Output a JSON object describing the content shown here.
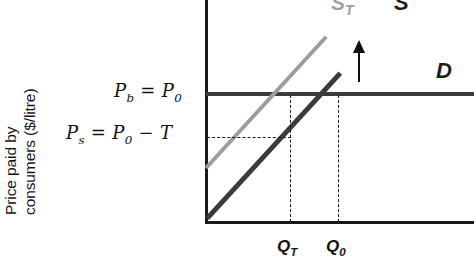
{
  "figure": {
    "type": "supply-demand-tax-incidence-diagram",
    "y_axis_label_line1": "Price paid by",
    "y_axis_label_line2": "consumers ($/litre)"
  },
  "price_labels": {
    "buyer_price": {
      "symbol": "P",
      "subscript": "b",
      "equals": "=",
      "value_symbol": "P",
      "value_subscript": "0",
      "full": "Pb = P0"
    },
    "seller_price": {
      "symbol": "P",
      "subscript": "s",
      "equals": "=",
      "value_symbol": "P",
      "value_subscript": "0",
      "minus": "−",
      "tax_symbol": "T",
      "full": "Ps = P0 − T"
    }
  },
  "curve_labels": {
    "supply_tax": {
      "symbol": "S",
      "subscript": "T"
    },
    "supply": {
      "symbol": "S"
    },
    "demand": {
      "symbol": "D"
    }
  },
  "quantity_labels": {
    "quantity_tax": {
      "symbol": "Q",
      "subscript": "T"
    },
    "quantity_original": {
      "symbol": "Q",
      "subscript": "0"
    }
  },
  "annotations": {
    "shift_arrow": "upward-shift-arrow"
  },
  "colors": {
    "supply_tax_curve": "#9d9d9d",
    "supply_curve": "#3b3b3b",
    "demand_curve": "#3b3b3b",
    "axis": "#1a1a1a",
    "guide_line": "#1a1a1a",
    "background": "#ffffff"
  },
  "chart_data": {
    "type": "line",
    "title": "",
    "xlabel": "",
    "ylabel": "Price paid by consumers ($/litre)",
    "grid": false,
    "legend": "inline-curve-labels",
    "series": [
      {
        "name": "D",
        "description": "Perfectly elastic (horizontal) demand curve at price P0",
        "points": [
          [
            0,
            72
          ],
          [
            100,
            72
          ]
        ]
      },
      {
        "name": "S",
        "description": "Original upward-sloping supply curve",
        "points": [
          [
            0,
            3
          ],
          [
            74,
            100
          ]
        ]
      },
      {
        "name": "ST",
        "description": "Supply curve shifted up by the tax T",
        "points": [
          [
            0,
            25
          ],
          [
            66,
            100
          ]
        ]
      }
    ],
    "markers": [
      {
        "name": "Q0",
        "label": "Q0",
        "x": 49,
        "y": 72,
        "description": "Pre-tax equilibrium quantity where S crosses D"
      },
      {
        "name": "QT",
        "label": "QT",
        "x": 32,
        "y": 72,
        "description": "Post-tax equilibrium quantity where ST crosses D"
      },
      {
        "name": "Pb",
        "label": "Pb = P0",
        "y": 72,
        "description": "Price paid by buyers, unchanged at P0"
      },
      {
        "name": "Ps",
        "label": "Ps = P0 - T",
        "y": 46,
        "description": "Price received by sellers, lower by the tax T"
      }
    ]
  }
}
